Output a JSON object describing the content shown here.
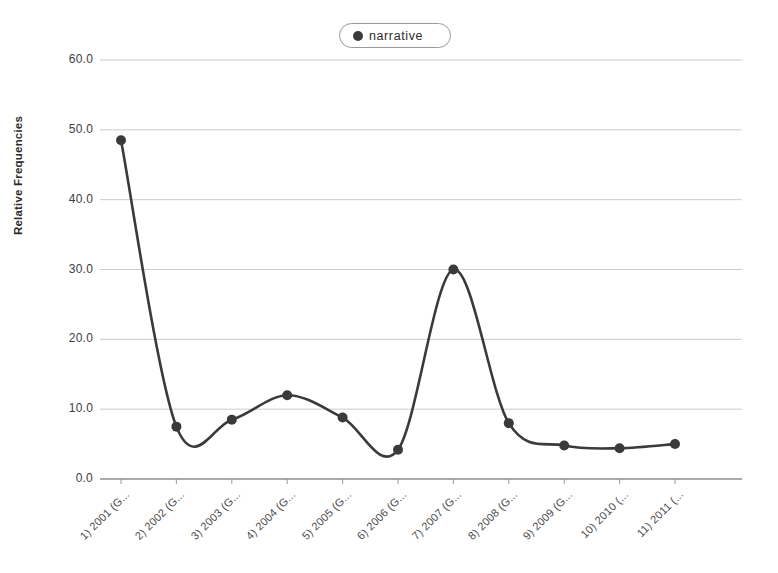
{
  "legend": {
    "position": "top-center",
    "entries": [
      {
        "label": "narrative",
        "marker": "filled-circle",
        "color": "#3a3a3a"
      }
    ]
  },
  "axes": {
    "ylabel": "Relative Frequencies",
    "yticks": [
      "60.0",
      "50.0",
      "40.0",
      "30.0",
      "20.0",
      "10.0",
      "0.0"
    ],
    "xticks": [
      "1) 2001 (G...",
      "2) 2002 (G...",
      "3) 2003 (G...",
      "4) 2004 (G...",
      "5) 2005 (G...",
      "6) 2006 (G...",
      "7) 2007 (G...",
      "8) 2008 (G...",
      "9) 2009 (G...",
      "10) 2010 (...",
      "11) 2011 (..."
    ]
  },
  "chart_data": {
    "type": "line",
    "title": "",
    "xlabel": "",
    "ylabel": "Relative Frequencies",
    "ylim": [
      0,
      60
    ],
    "ytick_step": 10,
    "grid": true,
    "legend_position": "top-center",
    "smoothing": "spline",
    "marker": "filled-circle",
    "line_color": "#3a3a3a",
    "categories": [
      "1) 2001 (G...",
      "2) 2002 (G...",
      "3) 2003 (G...",
      "4) 2004 (G...",
      "5) 2005 (G...",
      "6) 2006 (G...",
      "7) 2007 (G...",
      "8) 2008 (G...",
      "9) 2009 (G...",
      "10) 2010 (...",
      "11) 2011 (..."
    ],
    "series": [
      {
        "name": "narrative",
        "values": [
          48.5,
          7.5,
          8.5,
          12.0,
          8.8,
          4.2,
          30.0,
          8.0,
          4.8,
          4.4,
          5.0
        ]
      }
    ]
  }
}
